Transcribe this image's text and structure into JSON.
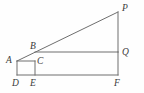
{
  "figure": {
    "kind": "geometry-diagram",
    "canvas": {
      "width": 144,
      "height": 93
    },
    "stroke_color": "#6e6e6e",
    "label_color": "#3a3a3a",
    "background_color": "#fefefe",
    "points": [
      {
        "id": "A",
        "label": "A",
        "x": 17,
        "y": 61,
        "label_x": 6,
        "label_y": 56
      },
      {
        "id": "B",
        "label": "B",
        "x": 35,
        "y": 52,
        "label_x": 30,
        "label_y": 42
      },
      {
        "id": "C",
        "label": "C",
        "x": 35,
        "y": 61,
        "label_x": 37,
        "label_y": 57
      },
      {
        "id": "D",
        "label": "D",
        "x": 17,
        "y": 75,
        "label_x": 12,
        "label_y": 79
      },
      {
        "id": "E",
        "label": "E",
        "x": 35,
        "y": 75,
        "label_x": 30,
        "label_y": 79
      },
      {
        "id": "F",
        "label": "F",
        "x": 118,
        "y": 75,
        "label_x": 114,
        "label_y": 79
      },
      {
        "id": "P",
        "label": "P",
        "x": 118,
        "y": 12,
        "label_x": 122,
        "label_y": 4
      },
      {
        "id": "Q",
        "label": "Q",
        "x": 118,
        "y": 52,
        "label_x": 122,
        "label_y": 48
      }
    ],
    "segments": [
      {
        "id": "AP",
        "name": "hypotenuse-A-to-P",
        "from": "A",
        "to": "P"
      },
      {
        "id": "BQ",
        "name": "segment-B-to-Q",
        "from": "B",
        "to": "Q"
      },
      {
        "id": "AC",
        "name": "segment-A-to-C",
        "from": "A",
        "to": "C"
      },
      {
        "id": "CE",
        "name": "segment-C-to-E",
        "from": "C",
        "to": "E"
      },
      {
        "id": "AD",
        "name": "segment-A-to-D",
        "from": "A",
        "to": "D"
      },
      {
        "id": "DF",
        "name": "base-D-to-F",
        "from": "D",
        "to": "F"
      },
      {
        "id": "QF",
        "name": "segment-Q-to-F",
        "from": "Q",
        "to": "F"
      },
      {
        "id": "PQ",
        "name": "segment-P-to-Q",
        "from": "P",
        "to": "Q"
      }
    ]
  }
}
